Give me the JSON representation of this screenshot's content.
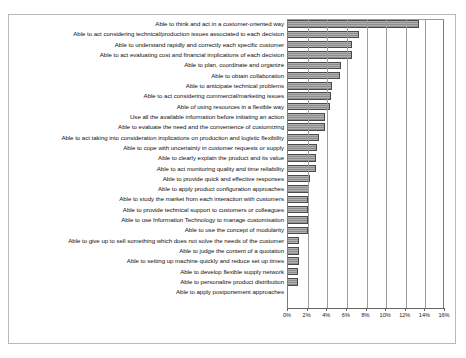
{
  "chart_data": {
    "type": "bar",
    "orientation": "horizontal",
    "title": "",
    "subtitle": "",
    "xlabel": "",
    "ylabel": "",
    "xlim": [
      0,
      16
    ],
    "x_unit": "%",
    "grid": true,
    "legend": "none",
    "xticks": [
      0,
      2,
      4,
      6,
      8,
      10,
      12,
      14,
      16
    ],
    "xtick_labels": [
      "0%",
      "2%",
      "4%",
      "6%",
      "8%",
      "10%",
      "12%",
      "14%",
      "16%"
    ],
    "categories": [
      "Able to think and act in a customer-oriented way",
      "Able to act considering technical/production issues associated to each decision",
      "Able to understand rapidly and correctly each specific customer",
      "Able to act evaluating cost and financial implications of each decision",
      "Able to plan, coordinate and organize",
      "Able to obtain collaboration",
      "Able to anticipate technical problems",
      "Able to act considering commercial/marketing issues",
      "Able of using resources in a flexible way",
      "Use all the available information before initiating an action",
      "Able to evaluate the need and the convenience of customizing",
      "Able to act taking into consideration implications on production and logistic flexibility",
      "Able to cope with uncertainty in customer requests or supply",
      "Able to clearly explain the product and its value",
      "Able to act monitoring quality and time reliability",
      "Able to provide quick and effective responses",
      "Able to apply product configuration approaches",
      "Able to study the market from each interaction with customers",
      "Able to provide technical support to customers or colleagues",
      "Able to use Information Technology to manage customisation",
      "Able to use the concept of modularity",
      "Able to give up to sell something which does not solve the needs of the customer",
      "Able to judge the content of a quotation",
      "Able to setting up machine quickly and reduce set up times",
      "Able to develop flexible supply network",
      "Able to personalize product distribution",
      "Able to apply postponement approaches"
    ],
    "values": [
      13.5,
      7.3,
      6.6,
      6.6,
      5.5,
      5.4,
      4.6,
      4.5,
      4.4,
      3.9,
      3.9,
      3.3,
      3.1,
      3.0,
      3.0,
      2.3,
      2.2,
      2.1,
      2.1,
      2.1,
      2.1,
      1.2,
      1.2,
      1.2,
      1.1,
      1.1,
      0.0
    ],
    "bar_color": "#a8a8a8",
    "bar_edge_color": "#4a4a4a",
    "bar_pattern": "horizontal-hatch"
  }
}
